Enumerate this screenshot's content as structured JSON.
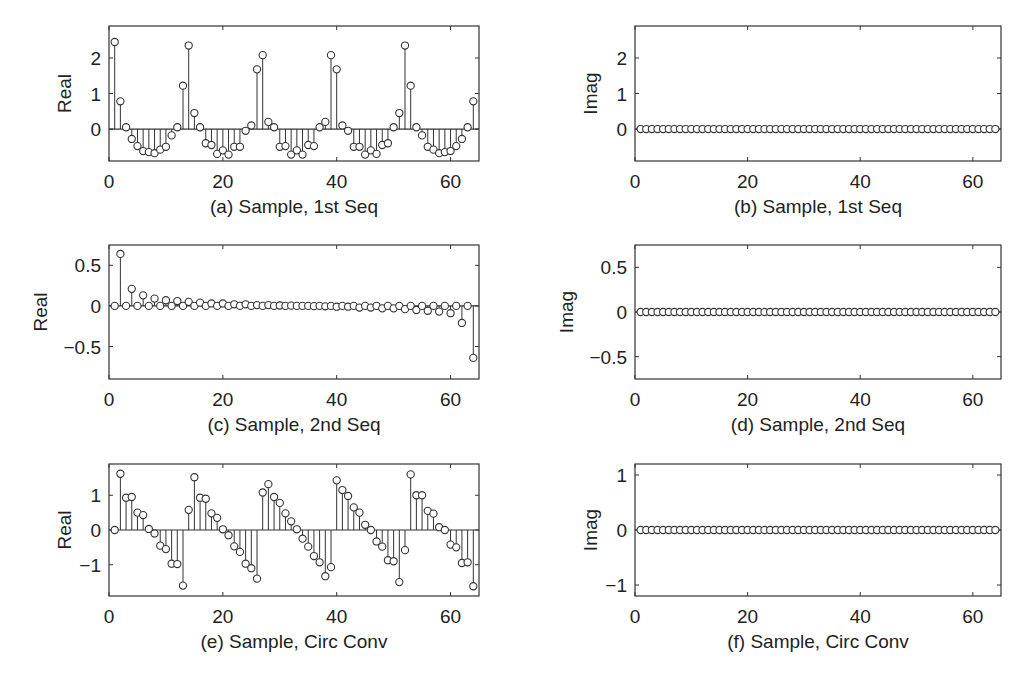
{
  "figure": {
    "panels": [
      {
        "id": "a",
        "caption": "(a) Sample, 1st Seq",
        "ylabel": "Real",
        "frame": {
          "x0": 109,
          "x1": 479,
          "y0": 26,
          "y1": 161
        },
        "xlim": [
          0,
          65
        ],
        "ylim": [
          -0.9,
          2.9
        ],
        "xticks": [
          0,
          20,
          40,
          60
        ],
        "yticks": [
          0,
          1,
          2
        ],
        "ytick_labels": [
          "0",
          "1",
          "2"
        ]
      },
      {
        "id": "b",
        "caption": "(b) Sample, 1st Seq",
        "ylabel": "Imag",
        "frame": {
          "x0": 635,
          "x1": 1001,
          "y0": 26,
          "y1": 161
        },
        "xlim": [
          0,
          65
        ],
        "ylim": [
          -0.9,
          2.9
        ],
        "xticks": [
          0,
          20,
          40,
          60
        ],
        "yticks": [
          0,
          1,
          2
        ],
        "ytick_labels": [
          "0",
          "1",
          "2"
        ]
      },
      {
        "id": "c",
        "caption": "(c) Sample, 2nd Seq",
        "ylabel": "Real",
        "frame": {
          "x0": 109,
          "x1": 479,
          "y0": 245,
          "y1": 379
        },
        "xlim": [
          0,
          65
        ],
        "ylim": [
          -0.9,
          0.75
        ],
        "xticks": [
          0,
          20,
          40,
          60
        ],
        "yticks": [
          -0.5,
          0,
          0.5
        ],
        "ytick_labels": [
          "−0.5",
          "0",
          "0.5"
        ]
      },
      {
        "id": "d",
        "caption": "(d) Sample, 2nd Seq",
        "ylabel": "Imag",
        "frame": {
          "x0": 635,
          "x1": 1001,
          "y0": 245,
          "y1": 379
        },
        "xlim": [
          0,
          65
        ],
        "ylim": [
          -0.75,
          0.75
        ],
        "xticks": [
          0,
          20,
          40,
          60
        ],
        "yticks": [
          -0.5,
          0,
          0.5
        ],
        "ytick_labels": [
          "−0.5",
          "0",
          "0.5"
        ]
      },
      {
        "id": "e",
        "caption": "(e) Sample, Circ Conv",
        "ylabel": "Real",
        "frame": {
          "x0": 109,
          "x1": 479,
          "y0": 464,
          "y1": 596
        },
        "xlim": [
          0,
          65
        ],
        "ylim": [
          -1.9,
          1.9
        ],
        "xticks": [
          0,
          20,
          40,
          60
        ],
        "yticks": [
          -1,
          0,
          1
        ],
        "ytick_labels": [
          "−1",
          "0",
          "1"
        ]
      },
      {
        "id": "f",
        "caption": "(f) Sample, Circ Conv",
        "ylabel": "Imag",
        "frame": {
          "x0": 635,
          "x1": 1001,
          "y0": 464,
          "y1": 596
        },
        "xlim": [
          0,
          65
        ],
        "ylim": [
          -1.2,
          1.2
        ],
        "xticks": [
          0,
          20,
          40,
          60
        ],
        "yticks": [
          -1,
          0,
          1
        ],
        "ytick_labels": [
          "−1",
          "0",
          "1"
        ]
      }
    ]
  },
  "chart_data": [
    {
      "id": "a",
      "type": "stem",
      "title": "(a) Sample, 1st Seq",
      "xlabel": "Sample",
      "ylabel": "Real",
      "xlim": [
        0,
        65
      ],
      "ylim": [
        -0.9,
        2.9
      ],
      "grid": false,
      "x": [
        1,
        2,
        3,
        4,
        5,
        6,
        7,
        8,
        9,
        10,
        11,
        12,
        13,
        14,
        15,
        16,
        17,
        18,
        19,
        20,
        21,
        22,
        23,
        24,
        25,
        26,
        27,
        28,
        29,
        30,
        31,
        32,
        33,
        34,
        35,
        36,
        37,
        38,
        39,
        40,
        41,
        42,
        43,
        44,
        45,
        46,
        47,
        48,
        49,
        50,
        51,
        52,
        53,
        54,
        55,
        56,
        57,
        58,
        59,
        60,
        61,
        62,
        63,
        64
      ],
      "values": [
        2.45,
        0.78,
        0.05,
        -0.28,
        -0.48,
        -0.62,
        -0.65,
        -0.68,
        -0.58,
        -0.5,
        -0.18,
        0.05,
        1.22,
        2.35,
        0.45,
        0.05,
        -0.4,
        -0.45,
        -0.7,
        -0.6,
        -0.72,
        -0.5,
        -0.5,
        -0.05,
        0.1,
        1.68,
        2.08,
        0.2,
        0.05,
        -0.5,
        -0.48,
        -0.72,
        -0.6,
        -0.72,
        -0.45,
        -0.48,
        0.05,
        0.2,
        2.08,
        1.68,
        0.1,
        -0.05,
        -0.5,
        -0.5,
        -0.72,
        -0.6,
        -0.7,
        -0.45,
        -0.4,
        0.05,
        0.45,
        2.35,
        1.22,
        0.05,
        -0.18,
        -0.5,
        -0.58,
        -0.68,
        -0.65,
        -0.62,
        -0.48,
        -0.28,
        0.05,
        0.78
      ]
    },
    {
      "id": "b",
      "type": "stem",
      "title": "(b) Sample, 1st Seq",
      "xlabel": "Sample",
      "ylabel": "Imag",
      "xlim": [
        0,
        65
      ],
      "ylim": [
        -0.9,
        2.9
      ],
      "grid": false,
      "x_range": [
        1,
        64
      ],
      "constant_value": 0
    },
    {
      "id": "c",
      "type": "stem",
      "title": "(c) Sample, 2nd Seq",
      "xlabel": "Sample",
      "ylabel": "Real",
      "xlim": [
        0,
        65
      ],
      "ylim": [
        -0.9,
        0.75
      ],
      "grid": false,
      "x": [
        1,
        2,
        3,
        4,
        5,
        6,
        7,
        8,
        9,
        10,
        11,
        12,
        13,
        14,
        15,
        16,
        17,
        18,
        19,
        20,
        21,
        22,
        23,
        24,
        25,
        26,
        27,
        28,
        29,
        30,
        31,
        32,
        33,
        34,
        35,
        36,
        37,
        38,
        39,
        40,
        41,
        42,
        43,
        44,
        45,
        46,
        47,
        48,
        49,
        50,
        51,
        52,
        53,
        54,
        55,
        56,
        57,
        58,
        59,
        60,
        61,
        62,
        63,
        64
      ],
      "values": [
        0,
        0.64,
        0,
        0.21,
        0,
        0.13,
        0,
        0.09,
        0,
        0.07,
        0,
        0.06,
        0,
        0.05,
        0,
        0.04,
        0,
        0.03,
        0,
        0.03,
        0,
        0.02,
        0,
        0.02,
        0,
        0.01,
        0,
        0.01,
        0,
        0.005,
        0,
        0.003,
        0,
        0,
        0,
        -0.003,
        0,
        -0.005,
        0,
        -0.01,
        0,
        -0.01,
        0,
        -0.02,
        0,
        -0.02,
        0,
        -0.03,
        0,
        -0.03,
        0,
        -0.04,
        0,
        -0.05,
        0,
        -0.06,
        0,
        -0.07,
        0,
        -0.09,
        0,
        -0.21,
        0,
        -0.64
      ]
    },
    {
      "id": "d",
      "type": "stem",
      "title": "(d) Sample, 2nd Seq",
      "xlabel": "Sample",
      "ylabel": "Imag",
      "xlim": [
        0,
        65
      ],
      "ylim": [
        -0.75,
        0.75
      ],
      "grid": false,
      "x_range": [
        1,
        64
      ],
      "constant_value": 0
    },
    {
      "id": "e",
      "type": "stem",
      "title": "(e) Sample, Circ Conv",
      "xlabel": "Sample",
      "ylabel": "Real",
      "xlim": [
        0,
        65
      ],
      "ylim": [
        -1.9,
        1.9
      ],
      "grid": false,
      "x": [
        1,
        2,
        3,
        4,
        5,
        6,
        7,
        8,
        9,
        10,
        11,
        12,
        13,
        14,
        15,
        16,
        17,
        18,
        19,
        20,
        21,
        22,
        23,
        24,
        25,
        26,
        27,
        28,
        29,
        30,
        31,
        32,
        33,
        34,
        35,
        36,
        37,
        38,
        39,
        40,
        41,
        42,
        43,
        44,
        45,
        46,
        47,
        48,
        49,
        50,
        51,
        52,
        53,
        54,
        55,
        56,
        57,
        58,
        59,
        60,
        61,
        62,
        63,
        64
      ],
      "values": [
        0,
        1.62,
        0.93,
        0.95,
        0.5,
        0.43,
        0.03,
        -0.1,
        -0.45,
        -0.55,
        -0.97,
        -0.98,
        -1.6,
        0.58,
        1.52,
        0.93,
        0.9,
        0.48,
        0.35,
        0.02,
        -0.15,
        -0.47,
        -0.63,
        -0.97,
        -1.1,
        -1.4,
        1.08,
        1.32,
        0.95,
        0.78,
        0.48,
        0.25,
        0.02,
        -0.25,
        -0.48,
        -0.75,
        -0.93,
        -1.33,
        -1.07,
        1.43,
        1.15,
        0.98,
        0.65,
        0.5,
        0.15,
        0.0,
        -0.33,
        -0.48,
        -0.87,
        -0.9,
        -1.5,
        -0.58,
        1.6,
        1.0,
        1.0,
        0.55,
        0.47,
        0.08,
        0.0,
        -0.42,
        -0.5,
        -0.95,
        -0.93,
        -1.62
      ]
    },
    {
      "id": "f",
      "type": "stem",
      "title": "(f) Sample, Circ Conv",
      "xlabel": "Sample",
      "ylabel": "Imag",
      "xlim": [
        0,
        65
      ],
      "ylim": [
        -1.2,
        1.2
      ],
      "grid": false,
      "x_range": [
        1,
        64
      ],
      "constant_value": 0
    }
  ]
}
